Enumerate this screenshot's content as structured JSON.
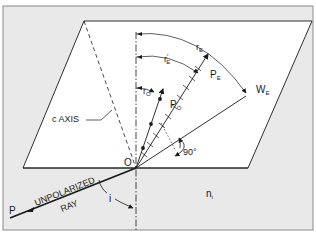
{
  "figure": {
    "labels": {
      "c_axis": "c AXIS",
      "origin": "O",
      "p_o": "P",
      "p_o_sub": "O",
      "p_e": "P",
      "p_e_sub": "E",
      "w_e": "W",
      "w_e_sub": "E",
      "r_o": "r",
      "r_o_sub": "O",
      "r_e_prime": "r",
      "r_e_prime_sub": "E",
      "r_e_prime_mark": "′",
      "r_e": "r",
      "r_e_sub": "E",
      "angle_90": "90°",
      "incident_p": "P",
      "unpolarized": "UNPOLARIZED",
      "ray": "RAY",
      "angle_i": "i",
      "medium_n": "n",
      "medium_n_sub": "i"
    },
    "colors": {
      "background_panel": "#e9e9e9",
      "crystal_face": "#ffffff",
      "lines": "#1a1a1a",
      "frame_border": "#8a8a8a"
    }
  }
}
